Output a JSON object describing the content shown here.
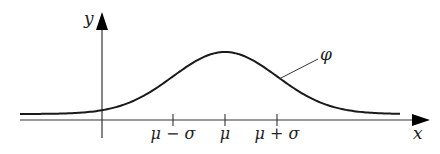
{
  "figure": {
    "curve_label": "φ",
    "axes": {
      "x_label": "x",
      "y_label": "y"
    },
    "ticks": [
      {
        "id": "mu_minus_sigma",
        "label": "μ − σ"
      },
      {
        "id": "mu",
        "label": "μ"
      },
      {
        "id": "mu_plus_sigma",
        "label": "μ + σ"
      }
    ],
    "colors": {
      "line": "#1a1a1a",
      "axis": "#333333",
      "background": "#ffffff"
    }
  }
}
